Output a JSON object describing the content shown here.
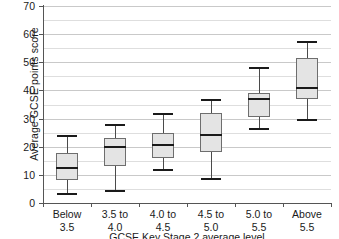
{
  "chart_data": {
    "type": "box",
    "title": "",
    "xlabel": "GCSE Key Stage 2 average level",
    "ylabel": "Average GCSE points score",
    "ylim": [
      0,
      70
    ],
    "ytick_step": 10,
    "yminor_step": 5,
    "grid": true,
    "legend": "none",
    "categories": [
      "Below 3.5",
      "3.5 to 4.0",
      "4.0 to 4.5",
      "4.5 to 5.0",
      "5.0 to 5.5",
      "Above 5.5"
    ],
    "category_lines": [
      [
        "Below",
        "3.5"
      ],
      [
        "3.5 to",
        "4.0"
      ],
      [
        "4.0 to",
        "4.5"
      ],
      [
        "4.5 to",
        "5.0"
      ],
      [
        "5.0 to",
        "5.5"
      ],
      [
        "Above",
        "5.5"
      ]
    ],
    "ytick_labels": [
      "0",
      "10",
      "20",
      "30",
      "40",
      "50",
      "60",
      "70"
    ],
    "ytick_values": [
      0,
      10,
      20,
      30,
      40,
      50,
      60,
      70
    ],
    "yminor_values": [
      5,
      15,
      25,
      35,
      45,
      55,
      65
    ],
    "boxes": [
      {
        "category": "Below 3.5",
        "whisker_low": 3.5,
        "q1": 8.0,
        "median": 12.5,
        "q3": 17.8,
        "whisker_high": 24.0
      },
      {
        "category": "3.5 to 4.0",
        "whisker_low": 4.5,
        "q1": 13.0,
        "median": 20.0,
        "q3": 23.0,
        "whisker_high": 28.0
      },
      {
        "category": "4.0 to 4.5",
        "whisker_low": 12.0,
        "q1": 16.0,
        "median": 20.5,
        "q3": 25.0,
        "whisker_high": 32.0
      },
      {
        "category": "4.5 to 5.0",
        "whisker_low": 9.0,
        "q1": 18.0,
        "median": 24.0,
        "q3": 32.0,
        "whisker_high": 37.0
      },
      {
        "category": "5.0 to 5.5",
        "whisker_low": 26.5,
        "q1": 30.5,
        "median": 37.0,
        "q3": 39.0,
        "whisker_high": 48.5
      },
      {
        "category": "Above 5.5",
        "whisker_low": 30.0,
        "q1": 37.0,
        "median": 41.0,
        "q3": 51.5,
        "whisker_high": 57.5
      }
    ],
    "colors": {
      "box_fill": "#e4e4e4",
      "box_border": "#6e6e6e",
      "median": "#1a1a1a",
      "whisker": "#4a4a4a",
      "gridline_major": "#c9c9c9",
      "gridline_minor": "#dedede",
      "axis": "#555555",
      "text": "#1a1a1a",
      "background": "#ffffff"
    }
  }
}
